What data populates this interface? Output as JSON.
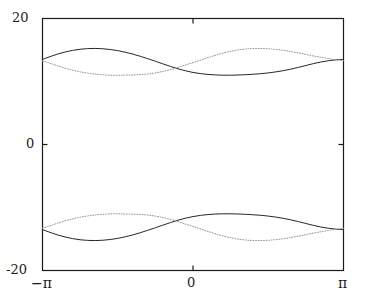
{
  "figure": {
    "background_color": "#ffffff",
    "width": 365,
    "height": 302
  },
  "axes": {
    "frame_color": "#1a1a1a",
    "x_tick_labels": [
      "−π",
      "0",
      "π"
    ],
    "y_tick_labels": [
      "20",
      "0",
      "-20"
    ]
  },
  "chart_data": {
    "type": "line",
    "title": "",
    "xlabel": "",
    "ylabel": "",
    "xlim": [
      -3.141592653589793,
      3.141592653589793
    ],
    "ylim": [
      -20,
      20
    ],
    "xticks": [
      -3.141592653589793,
      0,
      3.141592653589793
    ],
    "xticklabels": [
      "−π",
      "0",
      "π"
    ],
    "yticks": [
      -20,
      0,
      20
    ],
    "yticklabels": [
      "20",
      "0",
      "-20"
    ],
    "grid": false,
    "legend": null,
    "x": [
      -3.1416,
      -2.9845,
      -2.8274,
      -2.6704,
      -2.5133,
      -2.3562,
      -2.1991,
      -2.042,
      -1.885,
      -1.7279,
      -1.5708,
      -1.4137,
      -1.2566,
      -1.0996,
      -0.9425,
      -0.7854,
      -0.6283,
      -0.4712,
      -0.3142,
      -0.1571,
      0.0,
      0.1571,
      0.3142,
      0.4712,
      0.6283,
      0.7854,
      0.9425,
      1.0996,
      1.2566,
      1.4137,
      1.5708,
      1.7279,
      1.885,
      2.042,
      2.1991,
      2.3562,
      2.5133,
      2.6704,
      2.8274,
      2.9845,
      3.1416
    ],
    "series": [
      {
        "name": "upper-solid",
        "style": "solid",
        "color": "#1a1a1a",
        "values": [
          13.5,
          13.95,
          14.35,
          14.68,
          14.94,
          15.12,
          15.22,
          15.25,
          15.2,
          15.08,
          14.9,
          14.65,
          14.35,
          14.0,
          13.62,
          13.22,
          12.8,
          12.4,
          12.02,
          11.7,
          11.44,
          11.25,
          11.12,
          11.04,
          11.0,
          11.0,
          11.03,
          11.08,
          11.15,
          11.24,
          11.36,
          11.52,
          11.72,
          11.96,
          12.24,
          12.54,
          12.84,
          13.1,
          13.3,
          13.44,
          13.5
        ]
      },
      {
        "name": "upper-dotted",
        "style": "dotted",
        "color": "#9a9a9a",
        "values": [
          13.3,
          12.9,
          12.5,
          12.12,
          11.8,
          11.54,
          11.34,
          11.18,
          11.07,
          11.01,
          11.0,
          11.02,
          11.05,
          11.1,
          11.2,
          11.36,
          11.6,
          11.9,
          12.25,
          12.62,
          13.0,
          13.4,
          13.8,
          14.18,
          14.52,
          14.8,
          15.02,
          15.16,
          15.24,
          15.25,
          15.2,
          15.1,
          14.95,
          14.76,
          14.54,
          14.3,
          14.06,
          13.84,
          13.64,
          13.46,
          13.3
        ]
      },
      {
        "name": "lower-solid",
        "style": "solid",
        "color": "#1a1a1a",
        "values": [
          -13.5,
          -13.95,
          -14.35,
          -14.68,
          -14.94,
          -15.12,
          -15.22,
          -15.25,
          -15.2,
          -15.08,
          -14.9,
          -14.65,
          -14.35,
          -14.0,
          -13.62,
          -13.22,
          -12.8,
          -12.4,
          -12.02,
          -11.7,
          -11.44,
          -11.25,
          -11.12,
          -11.04,
          -11.0,
          -11.0,
          -11.03,
          -11.08,
          -11.15,
          -11.24,
          -11.36,
          -11.52,
          -11.72,
          -11.96,
          -12.24,
          -12.54,
          -12.84,
          -13.1,
          -13.3,
          -13.44,
          -13.5
        ]
      },
      {
        "name": "lower-dotted",
        "style": "dotted",
        "color": "#9a9a9a",
        "values": [
          -13.3,
          -12.9,
          -12.5,
          -12.12,
          -11.8,
          -11.54,
          -11.34,
          -11.18,
          -11.07,
          -11.01,
          -11.0,
          -11.02,
          -11.05,
          -11.1,
          -11.2,
          -11.36,
          -11.6,
          -11.9,
          -12.25,
          -12.62,
          -13.0,
          -13.4,
          -13.8,
          -14.18,
          -14.52,
          -14.8,
          -15.02,
          -15.16,
          -15.24,
          -15.25,
          -15.2,
          -15.1,
          -14.95,
          -14.76,
          -14.54,
          -14.3,
          -14.06,
          -13.84,
          -13.64,
          -13.46,
          -13.3
        ]
      }
    ]
  }
}
